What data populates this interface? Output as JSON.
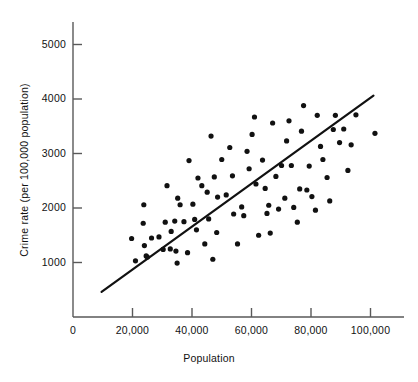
{
  "chart_data": {
    "type": "scatter",
    "title": "",
    "xlabel": "Population",
    "ylabel": "Crime rate (per 100,000 population)",
    "xlim": [
      0,
      108000
    ],
    "ylim": [
      0,
      5500
    ],
    "grid": false,
    "legend": null,
    "x_ticks": [
      {
        "value": 0,
        "label": "0"
      },
      {
        "value": 20000,
        "label": "20,000"
      },
      {
        "value": 40000,
        "label": "40,000"
      },
      {
        "value": 60000,
        "label": "60,000"
      },
      {
        "value": 80000,
        "label": "80,000"
      },
      {
        "value": 100000,
        "label": "100,000"
      }
    ],
    "y_ticks": [
      {
        "value": 1000,
        "label": "1000"
      },
      {
        "value": 2000,
        "label": "2000"
      },
      {
        "value": 3000,
        "label": "3000"
      },
      {
        "value": 4000,
        "label": "4000"
      },
      {
        "value": 5000,
        "label": "5000"
      }
    ],
    "marker": {
      "shape": "circle",
      "color": "#111111",
      "size": 3.4
    },
    "series": [
      {
        "name": "cities",
        "points": [
          [
            19700,
            1440
          ],
          [
            21000,
            1030
          ],
          [
            23800,
            2060
          ],
          [
            23600,
            1720
          ],
          [
            24000,
            1310
          ],
          [
            24600,
            1120
          ],
          [
            25000,
            1100
          ],
          [
            26400,
            1450
          ],
          [
            28900,
            1470
          ],
          [
            30300,
            1240
          ],
          [
            31000,
            1740
          ],
          [
            31600,
            2410
          ],
          [
            32700,
            1250
          ],
          [
            33000,
            1570
          ],
          [
            34200,
            1760
          ],
          [
            34600,
            1210
          ],
          [
            35000,
            990
          ],
          [
            35200,
            2180
          ],
          [
            36000,
            2060
          ],
          [
            37300,
            1750
          ],
          [
            38500,
            1180
          ],
          [
            39000,
            2870
          ],
          [
            40300,
            2070
          ],
          [
            40900,
            1790
          ],
          [
            41500,
            1600
          ],
          [
            42000,
            2550
          ],
          [
            43300,
            2410
          ],
          [
            44300,
            1340
          ],
          [
            45100,
            2290
          ],
          [
            45600,
            1800
          ],
          [
            46400,
            3320
          ],
          [
            47000,
            1060
          ],
          [
            47500,
            2570
          ],
          [
            48300,
            1550
          ],
          [
            48600,
            2200
          ],
          [
            50000,
            2890
          ],
          [
            51500,
            2240
          ],
          [
            52700,
            3110
          ],
          [
            53600,
            2590
          ],
          [
            54000,
            1890
          ],
          [
            55300,
            1340
          ],
          [
            56700,
            2020
          ],
          [
            57400,
            1860
          ],
          [
            58500,
            3040
          ],
          [
            59200,
            2720
          ],
          [
            60200,
            3350
          ],
          [
            61000,
            3670
          ],
          [
            61500,
            2440
          ],
          [
            62400,
            1500
          ],
          [
            63700,
            2880
          ],
          [
            64600,
            2360
          ],
          [
            65200,
            1900
          ],
          [
            65800,
            2050
          ],
          [
            66300,
            1540
          ],
          [
            67100,
            3560
          ],
          [
            68200,
            2580
          ],
          [
            69100,
            1980
          ],
          [
            70100,
            2780
          ],
          [
            71200,
            2180
          ],
          [
            71800,
            3230
          ],
          [
            72600,
            3600
          ],
          [
            73400,
            2780
          ],
          [
            74200,
            2010
          ],
          [
            75400,
            1740
          ],
          [
            76200,
            2350
          ],
          [
            76800,
            3410
          ],
          [
            77500,
            3880
          ],
          [
            78600,
            2330
          ],
          [
            79400,
            2770
          ],
          [
            80300,
            2210
          ],
          [
            81500,
            1960
          ],
          [
            82100,
            3700
          ],
          [
            83200,
            3130
          ],
          [
            84000,
            2890
          ],
          [
            85400,
            2560
          ],
          [
            86300,
            2130
          ],
          [
            87500,
            3440
          ],
          [
            88200,
            3700
          ],
          [
            89600,
            3200
          ],
          [
            91000,
            3450
          ],
          [
            92400,
            2690
          ],
          [
            93500,
            3160
          ],
          [
            95100,
            3710
          ],
          [
            101500,
            3370
          ]
        ]
      }
    ],
    "fit_line": {
      "name": "least-squares regression line",
      "color": "#111111",
      "width": 2.2,
      "x_start": 9600,
      "y_start": 460,
      "x_end": 101000,
      "y_end": 4060
    }
  },
  "axes": {
    "x_title": "Population",
    "y_title": "Crime rate (per 100,000 population)",
    "axis_color": "#5a5a5a"
  }
}
